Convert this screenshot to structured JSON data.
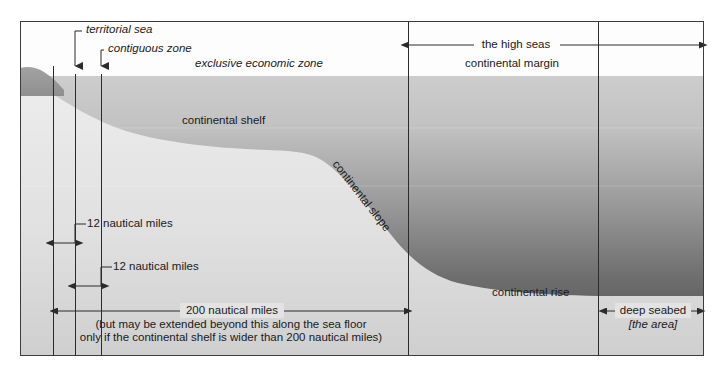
{
  "diagram": {
    "frame": {
      "x": 20,
      "y": 21,
      "width": 684,
      "height": 335
    },
    "colors": {
      "sky": "#fdfdfd",
      "water_top": "#c9c9c9",
      "water_bottom": "#4a4a4a",
      "seafloor_top": "#e9e9e9",
      "seafloor_bottom": "#d2d2d2",
      "land": "#9a9a9a",
      "frame_border": "#3c3c3c",
      "line": "#2b2b2b",
      "text": "#1a1a1a"
    },
    "sea_level_y": 76
  },
  "callouts": [
    {
      "name": "territorial-sea",
      "text": "territorial sea",
      "style": "italic",
      "x": 84,
      "y": 28,
      "leader_x": 74,
      "arrow_x": 75,
      "arrow_y_top": 36,
      "arrow_y_bottom": 74
    },
    {
      "name": "contiguous-zone",
      "text": "contiguous zone",
      "style": "italic",
      "x": 106,
      "y": 47,
      "leader_x": 101,
      "arrow_x": 101,
      "arrow_y_top": 55,
      "arrow_y_bottom": 74
    }
  ],
  "zone_labels": [
    {
      "name": "exclusive-economic-zone",
      "text": "exclusive economic zone",
      "style": "italic",
      "x": 194,
      "y": 62
    },
    {
      "name": "continental-margin",
      "text": "continental margin",
      "style": "normal",
      "x": 464,
      "y": 62
    },
    {
      "name": "continental-shelf",
      "text": "continental shelf",
      "style": "normal",
      "x": 182,
      "y": 118
    },
    {
      "name": "continental-slope",
      "text": "continental slope",
      "style": "normal",
      "x": 340,
      "y": 160,
      "rotation": 52
    },
    {
      "name": "continental-rise",
      "text": "continental rise",
      "style": "normal",
      "x": 492,
      "y": 290
    }
  ],
  "measures": [
    {
      "name": "high-seas",
      "text": "the high seas",
      "x1": 408,
      "x2": 700,
      "y": 45,
      "label_x": 516,
      "label_y": 38,
      "arrow_left": true,
      "arrow_right": true
    },
    {
      "name": "territorial-sea-width",
      "text": "12 nautical miles",
      "x1": 53,
      "x2": 75,
      "y": 243,
      "leader_from_x": 75,
      "leader_from_y": 243,
      "leader_to_y": 228,
      "label_x": 84,
      "label_y": 221,
      "arrow_left": true,
      "arrow_right": true
    },
    {
      "name": "contiguous-zone-width",
      "text": "12 nautical miles",
      "x1": 75,
      "x2": 101,
      "y": 286,
      "leader_from_x": 101,
      "leader_from_y": 286,
      "leader_to_y": 271,
      "label_x": 110,
      "label_y": 264,
      "arrow_left": true,
      "arrow_right": true
    },
    {
      "name": "two-hundred-nautical-miles",
      "text": "200 nautical miles",
      "x1": 57,
      "x2": 405,
      "y": 311,
      "label_x": 231,
      "label_y": 304,
      "arrow_left": true,
      "arrow_right": true
    },
    {
      "name": "deep-seabed",
      "text": "deep seabed",
      "x1": 606,
      "x2": 698,
      "y": 311,
      "label_x": 652,
      "label_y": 304,
      "arrow_left": true,
      "arrow_right": true
    }
  ],
  "notes": [
    {
      "name": "two-hundred-nm-note",
      "line1": "(but may be extended beyond this along the sea floor",
      "line2": "only if the continental shelf is wider than 200 nautical miles)",
      "x": 231,
      "y": 320
    },
    {
      "name": "deep-seabed-subtitle",
      "line1": "[the area]",
      "style": "italic",
      "x": 652,
      "y": 320
    }
  ],
  "boundary_lines": [
    {
      "name": "baseline",
      "x": 53,
      "y1": 66,
      "y2": 356
    },
    {
      "name": "territorial-sea-limit",
      "x": 75,
      "y1": 74,
      "y2": 356
    },
    {
      "name": "contiguous-zone-limit",
      "x": 101,
      "y1": 74,
      "y2": 356
    },
    {
      "name": "eez-200nm-limit",
      "x": 408,
      "y1": 21,
      "y2": 356
    },
    {
      "name": "deep-seabed-limit",
      "x": 598,
      "y1": 21,
      "y2": 356
    }
  ]
}
